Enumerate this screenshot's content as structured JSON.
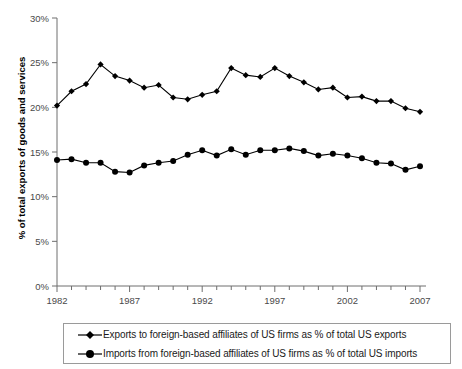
{
  "chart_data": {
    "type": "line",
    "title": "",
    "subtitle": "",
    "xlabel": "",
    "ylabel": "% of total exports of goods and services",
    "xlim": [
      1982,
      2007
    ],
    "ylim": [
      0,
      30
    ],
    "yticks": [
      0,
      5,
      10,
      15,
      20,
      25,
      30
    ],
    "ytick_labels": [
      "0%",
      "5%",
      "10%",
      "15%",
      "20%",
      "25%",
      "30%"
    ],
    "xticks": [
      1982,
      1987,
      1992,
      1997,
      2002,
      2007
    ],
    "xtick_labels": [
      "1982",
      "1987",
      "1992",
      "1997",
      "2002",
      "2007"
    ],
    "xtick_minor_every": 1,
    "grid": false,
    "legend_position": "below",
    "x": [
      1982,
      1983,
      1984,
      1985,
      1986,
      1987,
      1988,
      1989,
      1990,
      1991,
      1992,
      1993,
      1994,
      1995,
      1996,
      1997,
      1998,
      1999,
      2000,
      2001,
      2002,
      2003,
      2004,
      2005,
      2006,
      2007
    ],
    "series": [
      {
        "name": "Exports to foreign-based affiliates of US firms as % of total US exports",
        "marker": "diamond",
        "color": "#000000",
        "values": [
          20.2,
          21.8,
          22.6,
          24.8,
          23.5,
          23.0,
          22.2,
          22.5,
          21.1,
          20.9,
          21.4,
          21.8,
          24.4,
          23.6,
          23.4,
          24.4,
          23.5,
          22.8,
          22.0,
          22.2,
          21.1,
          21.2,
          20.7,
          20.7,
          19.9,
          19.5
        ]
      },
      {
        "name": "Imports from foreign-based affiliates of US firms as % of total US imports",
        "marker": "circle",
        "color": "#000000",
        "values": [
          14.1,
          14.2,
          13.8,
          13.8,
          12.8,
          12.7,
          13.5,
          13.8,
          14.0,
          14.7,
          15.2,
          14.6,
          15.3,
          14.7,
          15.2,
          15.2,
          15.4,
          15.1,
          14.6,
          14.8,
          14.6,
          14.3,
          13.8,
          13.7,
          13.0,
          13.4
        ]
      }
    ]
  },
  "legend": {
    "items": [
      {
        "label": "Exports to foreign-based affiliates of US firms as % of total US exports",
        "marker": "diamond"
      },
      {
        "label": "Imports from foreign-based affiliates of US firms as % of total US imports",
        "marker": "circle"
      }
    ]
  },
  "axis": {
    "y_title": "% of total exports of goods and services"
  }
}
